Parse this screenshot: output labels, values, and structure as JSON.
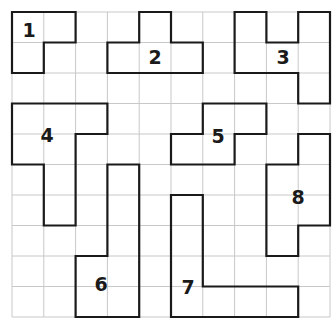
{
  "puzzle": {
    "grid": {
      "columns": 10,
      "rows": 10,
      "origin_x": 12,
      "origin_y": 12,
      "cell_width": 31.8,
      "cell_height": 30.5,
      "grid_line_color": "#c8c8c8",
      "outline_color": "#1a1a1a"
    },
    "pieces": [
      {
        "id": "1",
        "label": "1",
        "cells": [
          [
            0,
            0
          ],
          [
            1,
            0
          ],
          [
            0,
            1
          ]
        ],
        "label_pos": [
          29,
          30
        ]
      },
      {
        "id": "2",
        "label": "2",
        "cells": [
          [
            4,
            0
          ],
          [
            3,
            1
          ],
          [
            4,
            1
          ],
          [
            5,
            1
          ]
        ],
        "label_pos": [
          155,
          57
        ]
      },
      {
        "id": "3",
        "label": "3",
        "cells": [
          [
            7,
            0
          ],
          [
            7,
            1
          ],
          [
            8,
            1
          ],
          [
            9,
            0
          ],
          [
            9,
            1
          ],
          [
            9,
            2
          ]
        ],
        "label_pos": [
          283,
          57
        ]
      },
      {
        "id": "4",
        "label": "4",
        "cells": [
          [
            0,
            3
          ],
          [
            1,
            3
          ],
          [
            2,
            3
          ],
          [
            0,
            4
          ],
          [
            1,
            4
          ],
          [
            1,
            5
          ],
          [
            1,
            6
          ]
        ],
        "label_pos": [
          47,
          135
        ]
      },
      {
        "id": "5",
        "label": "5",
        "cells": [
          [
            6,
            3
          ],
          [
            7,
            3
          ],
          [
            5,
            4
          ],
          [
            6,
            4
          ]
        ],
        "label_pos": [
          218,
          136
        ]
      },
      {
        "id": "6",
        "label": "6",
        "cells": [
          [
            3,
            5
          ],
          [
            3,
            6
          ],
          [
            3,
            7
          ],
          [
            2,
            8
          ],
          [
            3,
            8
          ],
          [
            2,
            9
          ],
          [
            3,
            9
          ]
        ],
        "label_pos": [
          101,
          284
        ]
      },
      {
        "id": "7",
        "label": "7",
        "cells": [
          [
            5,
            6
          ],
          [
            5,
            7
          ],
          [
            5,
            8
          ],
          [
            5,
            9
          ],
          [
            6,
            9
          ],
          [
            7,
            9
          ],
          [
            8,
            9
          ]
        ],
        "label_pos": [
          188,
          287
        ]
      },
      {
        "id": "8",
        "label": "8",
        "cells": [
          [
            9,
            4
          ],
          [
            8,
            5
          ],
          [
            9,
            5
          ],
          [
            8,
            6
          ],
          [
            9,
            6
          ],
          [
            8,
            7
          ]
        ],
        "label_pos": [
          298,
          197
        ]
      }
    ]
  }
}
